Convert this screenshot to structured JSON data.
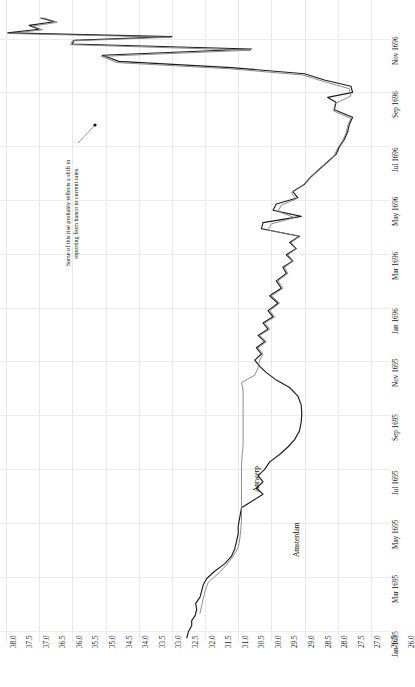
{
  "chart_data": {
    "type": "line",
    "title": "",
    "subtitle": "",
    "orientation": "rotated-90",
    "xlabel": "",
    "ylabel": "",
    "grid": true,
    "legend_position": "inline-direct-labels",
    "value_axis": {
      "name": "exchange rate",
      "position": "bottom",
      "direction": "left-to-right is high-to-low",
      "min": 26.0,
      "max": 38.0,
      "tick_step": 0.5,
      "ticks": [
        "38.0",
        "37.5",
        "37.0",
        "36.5",
        "36.0",
        "35.5",
        "35.0",
        "34.5",
        "34.0",
        "33.5",
        "33.0",
        "32.5",
        "32.0",
        "31.5",
        "31.0",
        "30.5",
        "30.0",
        "29.5",
        "29.0",
        "28.5",
        "28.0",
        "27.5",
        "27.0",
        "26.5",
        "26.0"
      ]
    },
    "date_axis": {
      "name": "date",
      "position": "right",
      "direction": "bottom-to-top is early-to-late",
      "ticks": [
        "Jan 1695",
        "Mar 1695",
        "May 1695",
        "Jul 1695",
        "Sep 1695",
        "Nov 1695",
        "Jan 1696",
        "Mar 1696",
        "May 1696",
        "Jul 1696",
        "Sep 1696",
        "Nov 1696"
      ]
    },
    "annotations": [
      {
        "name": "banco-shift-note",
        "lines": [
          "Some of this rise probably reflects a shift in",
          "reporting from banco to current rates."
        ],
        "text": "Some of this rise probably reflects a shift in reporting from banco to current rates.",
        "target_date": "Sep 1696",
        "target_value": 35.1
      }
    ],
    "series": [
      {
        "name": "Antwerp",
        "color": "#1c1c1c",
        "width": 1.15,
        "label_date": "Aug 1695",
        "label_value": 33.0,
        "points": [
          {
            "t": 0.0,
            "v": 32.55
          },
          {
            "t": 0.01,
            "v": 32.5
          },
          {
            "t": 0.02,
            "v": 32.4
          },
          {
            "t": 0.028,
            "v": 32.4
          },
          {
            "t": 0.036,
            "v": 32.3
          },
          {
            "t": 0.046,
            "v": 32.25
          },
          {
            "t": 0.056,
            "v": 32.28
          },
          {
            "t": 0.066,
            "v": 32.15
          },
          {
            "t": 0.076,
            "v": 32.1
          },
          {
            "t": 0.086,
            "v": 32.05
          },
          {
            "t": 0.096,
            "v": 31.95
          },
          {
            "t": 0.108,
            "v": 31.7
          },
          {
            "t": 0.12,
            "v": 31.4
          },
          {
            "t": 0.132,
            "v": 31.2
          },
          {
            "t": 0.144,
            "v": 31.1
          },
          {
            "t": 0.156,
            "v": 31.05
          },
          {
            "t": 0.168,
            "v": 31.0
          },
          {
            "t": 0.18,
            "v": 31.0
          },
          {
            "t": 0.195,
            "v": 30.95
          },
          {
            "t": 0.21,
            "v": 30.9
          },
          {
            "t": 0.222,
            "v": 30.55
          },
          {
            "t": 0.232,
            "v": 30.25
          },
          {
            "t": 0.242,
            "v": 30.45
          },
          {
            "t": 0.252,
            "v": 30.25
          },
          {
            "t": 0.262,
            "v": 30.4
          },
          {
            "t": 0.272,
            "v": 30.2
          },
          {
            "t": 0.284,
            "v": 30.05
          },
          {
            "t": 0.296,
            "v": 29.75
          },
          {
            "t": 0.308,
            "v": 29.5
          },
          {
            "t": 0.32,
            "v": 29.3
          },
          {
            "t": 0.334,
            "v": 29.15
          },
          {
            "t": 0.348,
            "v": 29.1
          },
          {
            "t": 0.362,
            "v": 29.08
          },
          {
            "t": 0.376,
            "v": 29.1
          },
          {
            "t": 0.39,
            "v": 29.2
          },
          {
            "t": 0.404,
            "v": 29.45
          },
          {
            "t": 0.416,
            "v": 29.85
          },
          {
            "t": 0.428,
            "v": 30.15
          },
          {
            "t": 0.438,
            "v": 30.35
          },
          {
            "t": 0.448,
            "v": 30.5
          },
          {
            "t": 0.458,
            "v": 30.3
          },
          {
            "t": 0.468,
            "v": 30.45
          },
          {
            "t": 0.478,
            "v": 30.2
          },
          {
            "t": 0.488,
            "v": 30.4
          },
          {
            "t": 0.498,
            "v": 30.1
          },
          {
            "t": 0.508,
            "v": 30.25
          },
          {
            "t": 0.518,
            "v": 29.95
          },
          {
            "t": 0.528,
            "v": 30.1
          },
          {
            "t": 0.54,
            "v": 29.8
          },
          {
            "t": 0.552,
            "v": 30.05
          },
          {
            "t": 0.564,
            "v": 29.7
          },
          {
            "t": 0.576,
            "v": 29.85
          },
          {
            "t": 0.588,
            "v": 29.55
          },
          {
            "t": 0.598,
            "v": 29.65
          },
          {
            "t": 0.608,
            "v": 29.35
          },
          {
            "t": 0.618,
            "v": 29.55
          },
          {
            "t": 0.628,
            "v": 29.25
          },
          {
            "t": 0.638,
            "v": 29.45
          },
          {
            "t": 0.648,
            "v": 29.15
          },
          {
            "t": 0.66,
            "v": 30.3
          },
          {
            "t": 0.67,
            "v": 30.25
          },
          {
            "t": 0.68,
            "v": 29.1
          },
          {
            "t": 0.69,
            "v": 29.95
          },
          {
            "t": 0.7,
            "v": 29.85
          },
          {
            "t": 0.71,
            "v": 29.2
          },
          {
            "t": 0.72,
            "v": 29.35
          },
          {
            "t": 0.732,
            "v": 29.0
          },
          {
            "t": 0.744,
            "v": 28.8
          },
          {
            "t": 0.756,
            "v": 28.55
          },
          {
            "t": 0.768,
            "v": 28.3
          },
          {
            "t": 0.78,
            "v": 28.05
          },
          {
            "t": 0.792,
            "v": 27.95
          },
          {
            "t": 0.804,
            "v": 27.8
          },
          {
            "t": 0.816,
            "v": 27.7
          },
          {
            "t": 0.828,
            "v": 27.65
          },
          {
            "t": 0.84,
            "v": 27.55
          },
          {
            "t": 0.852,
            "v": 28.1
          },
          {
            "t": 0.864,
            "v": 28.05
          },
          {
            "t": 0.872,
            "v": 28.3
          },
          {
            "t": 0.88,
            "v": 27.55
          },
          {
            "t": 0.89,
            "v": 27.6
          },
          {
            "t": 0.9,
            "v": 28.4
          },
          {
            "t": 0.91,
            "v": 29.0
          },
          {
            "t": 0.92,
            "v": 31.2
          },
          {
            "t": 0.93,
            "v": 34.6
          },
          {
            "t": 0.94,
            "v": 35.1
          },
          {
            "t": 0.95,
            "v": 30.6
          },
          {
            "t": 0.958,
            "v": 36.0
          },
          {
            "t": 0.964,
            "v": 35.95
          },
          {
            "t": 0.97,
            "v": 33.0
          },
          {
            "t": 0.976,
            "v": 37.95
          },
          {
            "t": 0.982,
            "v": 37.0
          },
          {
            "t": 0.988,
            "v": 37.3
          },
          {
            "t": 0.994,
            "v": 36.55
          },
          {
            "t": 1.0,
            "v": 36.95
          }
        ]
      },
      {
        "name": "Amsterdam",
        "color": "#7a7a7a",
        "width": 0.85,
        "label_date": "Jun 1695",
        "label_value": 30.0,
        "points": [
          {
            "t": 0.04,
            "v": 32.15
          },
          {
            "t": 0.052,
            "v": 32.1
          },
          {
            "t": 0.064,
            "v": 32.05
          },
          {
            "t": 0.076,
            "v": 32.0
          },
          {
            "t": 0.09,
            "v": 31.9
          },
          {
            "t": 0.104,
            "v": 31.6
          },
          {
            "t": 0.118,
            "v": 31.35
          },
          {
            "t": 0.132,
            "v": 31.15
          },
          {
            "t": 0.146,
            "v": 31.0
          },
          {
            "t": 0.16,
            "v": 30.95
          },
          {
            "t": 0.175,
            "v": 30.92
          },
          {
            "t": 0.19,
            "v": 30.9
          },
          {
            "t": 0.205,
            "v": 30.9
          },
          {
            "t": 0.22,
            "v": 30.9
          },
          {
            "t": 0.235,
            "v": 30.9
          },
          {
            "t": 0.25,
            "v": 30.9
          },
          {
            "t": 0.265,
            "v": 30.9
          },
          {
            "t": 0.28,
            "v": 30.9
          },
          {
            "t": 0.295,
            "v": 30.88
          },
          {
            "t": 0.31,
            "v": 30.85
          },
          {
            "t": 0.325,
            "v": 30.85
          },
          {
            "t": 0.34,
            "v": 30.85
          },
          {
            "t": 0.355,
            "v": 30.85
          },
          {
            "t": 0.37,
            "v": 30.85
          },
          {
            "t": 0.385,
            "v": 30.85
          },
          {
            "t": 0.4,
            "v": 30.85
          },
          {
            "t": 0.412,
            "v": 30.9
          },
          {
            "t": 0.424,
            "v": 30.5
          },
          {
            "t": 0.436,
            "v": 30.4
          },
          {
            "t": 0.448,
            "v": 30.35
          },
          {
            "t": 0.458,
            "v": 30.25
          },
          {
            "t": 0.468,
            "v": 30.4
          },
          {
            "t": 0.478,
            "v": 30.15
          },
          {
            "t": 0.488,
            "v": 30.35
          },
          {
            "t": 0.498,
            "v": 30.05
          },
          {
            "t": 0.508,
            "v": 30.2
          },
          {
            "t": 0.518,
            "v": 29.9
          },
          {
            "t": 0.528,
            "v": 30.05
          },
          {
            "t": 0.54,
            "v": 29.75
          },
          {
            "t": 0.552,
            "v": 30.0
          },
          {
            "t": 0.564,
            "v": 29.65
          },
          {
            "t": 0.576,
            "v": 29.8
          },
          {
            "t": 0.588,
            "v": 29.5
          },
          {
            "t": 0.598,
            "v": 29.6
          },
          {
            "t": 0.608,
            "v": 29.35
          },
          {
            "t": 0.618,
            "v": 29.5
          },
          {
            "t": 0.628,
            "v": 29.25
          },
          {
            "t": 0.638,
            "v": 29.4
          },
          {
            "t": 0.648,
            "v": 29.15
          },
          {
            "t": 0.658,
            "v": 30.1
          },
          {
            "t": 0.668,
            "v": 30.0
          },
          {
            "t": 0.678,
            "v": 29.3
          },
          {
            "t": 0.688,
            "v": 29.8
          },
          {
            "t": 0.698,
            "v": 29.7
          },
          {
            "t": 0.708,
            "v": 29.25
          },
          {
            "t": 0.718,
            "v": 29.4
          },
          {
            "t": 0.73,
            "v": 29.05
          },
          {
            "t": 0.742,
            "v": 28.85
          },
          {
            "t": 0.754,
            "v": 28.6
          },
          {
            "t": 0.766,
            "v": 28.35
          },
          {
            "t": 0.778,
            "v": 28.1
          },
          {
            "t": 0.79,
            "v": 28.0
          },
          {
            "t": 0.802,
            "v": 27.85
          },
          {
            "t": 0.814,
            "v": 27.75
          },
          {
            "t": 0.826,
            "v": 27.7
          },
          {
            "t": 0.838,
            "v": 27.6
          },
          {
            "t": 0.85,
            "v": 28.12
          },
          {
            "t": 0.862,
            "v": 28.08
          },
          {
            "t": 0.874,
            "v": 27.6
          },
          {
            "t": 0.886,
            "v": 27.65
          },
          {
            "t": 0.898,
            "v": 28.45
          },
          {
            "t": 0.908,
            "v": 29.05
          },
          {
            "t": 0.918,
            "v": 31.25
          },
          {
            "t": 0.928,
            "v": 34.65
          },
          {
            "t": 0.938,
            "v": 35.12
          },
          {
            "t": 0.948,
            "v": 30.62
          },
          {
            "t": 0.957,
            "v": 36.05
          },
          {
            "t": 0.963,
            "v": 36.0
          },
          {
            "t": 0.969,
            "v": 33.05
          },
          {
            "t": 0.975,
            "v": 37.9
          },
          {
            "t": 0.981,
            "v": 36.9
          },
          {
            "t": 0.987,
            "v": 37.2
          },
          {
            "t": 0.993,
            "v": 36.45
          },
          {
            "t": 1.0,
            "v": 36.85
          }
        ]
      }
    ]
  },
  "labels": {
    "antwerp": "Antwerp",
    "amsterdam": "Amsterdam"
  }
}
